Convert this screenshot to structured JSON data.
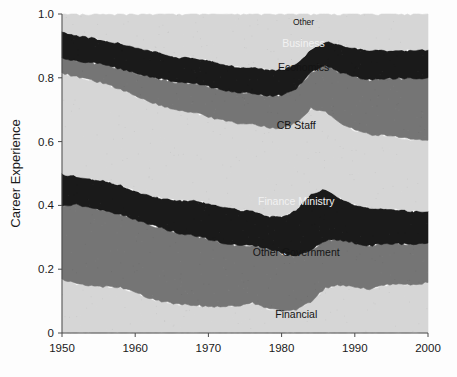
{
  "figure": {
    "background_color": "#fdfdfd",
    "plot_left": 62,
    "plot_right": 428,
    "plot_top": 14,
    "plot_bottom": 333
  },
  "chart_data": {
    "type": "area",
    "stacked": true,
    "normalized": true,
    "title": "",
    "xlabel": "",
    "ylabel": "Career Experience",
    "xlim": [
      1950,
      2000
    ],
    "ylim": [
      0,
      1.0
    ],
    "grid": false,
    "legend_position": "inline-labels",
    "x_ticks": [
      "1950",
      "1960",
      "1970",
      "1980",
      "1990",
      "2000"
    ],
    "x_tick_values": [
      1950,
      1960,
      1970,
      1980,
      1990,
      2000
    ],
    "y_ticks": [
      "0",
      "0.2",
      "0.4",
      "0.6",
      "0.8",
      "1.0"
    ],
    "y_tick_values": [
      0,
      0.2,
      0.4,
      0.6,
      0.8,
      1.0
    ],
    "x": [
      1950,
      1952,
      1954,
      1956,
      1958,
      1960,
      1962,
      1964,
      1966,
      1968,
      1970,
      1972,
      1974,
      1976,
      1978,
      1980,
      1982,
      1984,
      1986,
      1988,
      1990,
      1992,
      1994,
      1996,
      1998,
      2000
    ],
    "colors": {
      "financial": "#d6d6d6",
      "other_government": "#757575",
      "finance_ministry": "#1a1a1a",
      "cb_staff": "#d6d6d6",
      "economics": "#757575",
      "business": "#1a1a1a",
      "other": "#d6d6d6"
    },
    "series": [
      {
        "name": "Financial",
        "color": "#d6d6d6",
        "label": "Financial",
        "label_color": "dark",
        "values": [
          0.168,
          0.155,
          0.148,
          0.145,
          0.142,
          0.128,
          0.108,
          0.098,
          0.09,
          0.088,
          0.082,
          0.082,
          0.085,
          0.094,
          0.078,
          0.07,
          0.072,
          0.098,
          0.142,
          0.15,
          0.146,
          0.138,
          0.15,
          0.152,
          0.152,
          0.158
        ]
      },
      {
        "name": "Other Government",
        "color": "#757575",
        "label": "Other Government",
        "label_color": "dark",
        "values": [
          0.232,
          0.248,
          0.244,
          0.238,
          0.23,
          0.228,
          0.232,
          0.228,
          0.222,
          0.218,
          0.212,
          0.2,
          0.19,
          0.182,
          0.188,
          0.18,
          0.168,
          0.162,
          0.148,
          0.142,
          0.136,
          0.136,
          0.13,
          0.128,
          0.126,
          0.124
        ]
      },
      {
        "name": "Finance Ministry",
        "color": "#1a1a1a",
        "label": "Finance Ministry",
        "label_color": "light",
        "values": [
          0.098,
          0.088,
          0.092,
          0.094,
          0.092,
          0.09,
          0.092,
          0.096,
          0.104,
          0.11,
          0.114,
          0.116,
          0.112,
          0.108,
          0.1,
          0.116,
          0.146,
          0.178,
          0.162,
          0.132,
          0.122,
          0.118,
          0.112,
          0.108,
          0.104,
          0.1
        ]
      },
      {
        "name": "CB Staff",
        "color": "#d6d6d6",
        "label": "CB Staff",
        "label_color": "dark",
        "values": [
          0.318,
          0.312,
          0.308,
          0.304,
          0.3,
          0.296,
          0.292,
          0.288,
          0.282,
          0.276,
          0.27,
          0.268,
          0.27,
          0.274,
          0.278,
          0.276,
          0.272,
          0.266,
          0.242,
          0.236,
          0.232,
          0.23,
          0.228,
          0.226,
          0.224,
          0.222
        ]
      },
      {
        "name": "Economics",
        "color": "#757575",
        "label": "Economics",
        "label_color": "dark",
        "values": [
          0.046,
          0.05,
          0.056,
          0.06,
          0.064,
          0.072,
          0.08,
          0.084,
          0.086,
          0.09,
          0.094,
          0.096,
          0.096,
          0.094,
          0.098,
          0.104,
          0.108,
          0.112,
          0.144,
          0.156,
          0.166,
          0.172,
          0.178,
          0.184,
          0.192,
          0.196
        ]
      },
      {
        "name": "Business",
        "color": "#1a1a1a",
        "label": "Business",
        "label_color": "light",
        "values": [
          0.083,
          0.08,
          0.078,
          0.076,
          0.08,
          0.082,
          0.082,
          0.082,
          0.08,
          0.082,
          0.084,
          0.082,
          0.082,
          0.082,
          0.084,
          0.08,
          0.078,
          0.072,
          0.076,
          0.088,
          0.092,
          0.094,
          0.09,
          0.088,
          0.09,
          0.088
        ]
      },
      {
        "name": "Other",
        "color": "#d6d6d6",
        "label": "Other",
        "label_color": "dark",
        "values": [
          0.055,
          0.067,
          0.074,
          0.083,
          0.092,
          0.104,
          0.114,
          0.124,
          0.136,
          0.136,
          0.144,
          0.156,
          0.165,
          0.166,
          0.174,
          0.174,
          0.156,
          0.112,
          0.086,
          0.096,
          0.106,
          0.112,
          0.112,
          0.114,
          0.112,
          0.112
        ]
      }
    ],
    "annotations": [
      {
        "text": "Other",
        "x": 1983,
        "y": 0.965,
        "style": "small"
      },
      {
        "text": "Business",
        "x": 1983,
        "y": 0.895,
        "style": "light"
      },
      {
        "text": "Economics",
        "x": 1983,
        "y": 0.822,
        "style": "dark"
      },
      {
        "text": "CB Staff",
        "x": 1982,
        "y": 0.638,
        "style": "dark"
      },
      {
        "text": "Finance Ministry",
        "x": 1982,
        "y": 0.402,
        "style": "light"
      },
      {
        "text": "Other Government",
        "x": 1982,
        "y": 0.24,
        "style": "dark"
      },
      {
        "text": "Financial",
        "x": 1982,
        "y": 0.047,
        "style": "dark"
      }
    ]
  }
}
